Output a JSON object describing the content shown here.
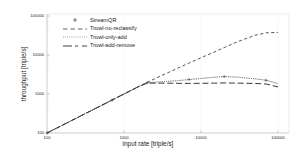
{
  "chart_data": {
    "type": "line",
    "title": "",
    "xlabel": "input rate [triple/s]",
    "ylabel": "throughput [triple/s]",
    "xscale": "log",
    "yscale": "log",
    "xlim": [
      100,
      100000
    ],
    "ylim": [
      100,
      100000
    ],
    "xticks": [
      100,
      1000,
      10000,
      100000
    ],
    "xtick_labels": [
      "100",
      "1000",
      "10000",
      "100000"
    ],
    "yticks": [
      100,
      1000,
      10000,
      100000
    ],
    "ytick_labels": [
      "100",
      "1000",
      "10000",
      "100000"
    ],
    "grid": false,
    "legend_position": "upper-left-inside",
    "series": [
      {
        "name": "StreamQR",
        "style": "dotted-plus-markers",
        "color": "#4a4a4a",
        "x": [
          100,
          200,
          400,
          700,
          1000,
          1500,
          2000,
          3000,
          5000,
          7000,
          10000,
          15000,
          20000,
          30000,
          50000,
          70000,
          100000
        ],
        "y": [
          100,
          200,
          400,
          700,
          1000,
          1500,
          1950,
          2050,
          2200,
          2350,
          2500,
          2700,
          2800,
          2700,
          2450,
          2250,
          1850
        ]
      },
      {
        "name": "Trowl-no-reclassify",
        "style": "dashed",
        "color": "#3a3a3a",
        "x": [
          100,
          200,
          400,
          700,
          1000,
          1500,
          2000,
          3000,
          5000,
          7000,
          10000,
          15000,
          20000,
          30000,
          50000,
          70000,
          100000
        ],
        "y": [
          100,
          200,
          400,
          700,
          1000,
          1500,
          2000,
          2900,
          4600,
          6200,
          8500,
          12000,
          15500,
          22000,
          32000,
          37000,
          38000
        ]
      },
      {
        "name": "Trowl-only-add",
        "style": "fine-dotted",
        "color": "#5a5a5a",
        "x": [
          100,
          200,
          400,
          700,
          1000,
          1500,
          2000,
          3000,
          5000,
          7000,
          10000,
          15000,
          20000,
          30000,
          50000,
          70000,
          100000
        ],
        "y": [
          100,
          200,
          400,
          700,
          1000,
          1500,
          1950,
          2050,
          2200,
          2350,
          2500,
          2700,
          2800,
          2700,
          2450,
          2250,
          1850
        ]
      },
      {
        "name": "Trowl-add-remove",
        "style": "long-dashed",
        "color": "#2e2e2e",
        "x": [
          100,
          200,
          400,
          700,
          1000,
          1500,
          2000,
          3000,
          5000,
          7000,
          10000,
          15000,
          20000,
          30000,
          50000,
          70000,
          100000
        ],
        "y": [
          100,
          200,
          400,
          700,
          1000,
          1500,
          1900,
          1900,
          1880,
          1870,
          1880,
          1900,
          1920,
          1900,
          1870,
          1800,
          1520
        ]
      }
    ]
  },
  "legend": {
    "items": [
      {
        "label": "StreamQR"
      },
      {
        "label": "Trowl-no-reclassify"
      },
      {
        "label": "Trowl-only-add"
      },
      {
        "label": "Trowl-add-remove"
      }
    ]
  }
}
